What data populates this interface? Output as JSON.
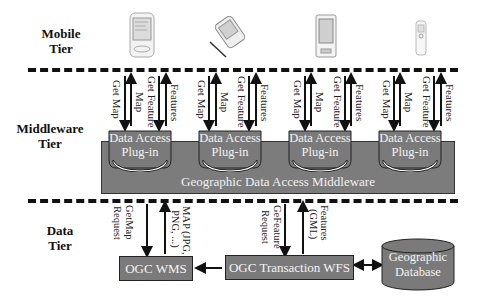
{
  "tiers": {
    "mobile": "Mobile Tier",
    "middleware": "Middleware Tier",
    "data": "Data Tier"
  },
  "tier_labels": {
    "mobile": [
      "Mobile",
      "Tier"
    ],
    "middleware": [
      "Middleware",
      "Tier"
    ],
    "data": [
      "Data",
      "Tier"
    ]
  },
  "devices": [
    {
      "name": "pocket-pc-device"
    },
    {
      "name": "pda-with-stylus-device"
    },
    {
      "name": "palm-device"
    },
    {
      "name": "mobile-phone-device"
    }
  ],
  "mobile_arrows": {
    "get_map": "Get Map",
    "map": "Map",
    "get_feature": "Get Feature",
    "features": "Features"
  },
  "plugins": [
    {
      "line1": "Data Access",
      "line2": "Plug-in"
    },
    {
      "line1": "Data Access",
      "line2": "Plug-in"
    },
    {
      "line1": "Data Access",
      "line2": "Plug-in"
    },
    {
      "line1": "Data Access",
      "line2": "Plug-in"
    }
  ],
  "middleware": {
    "label": "Geographic Data Access Middleware"
  },
  "data_arrows": {
    "getmap_request_1": "GetMap",
    "getmap_request_2": "Request",
    "map_response_1": "MAP (JPG,",
    "map_response_2": "PNG, ...)",
    "getfeature_request_1": "GeFeature",
    "getfeature_request_2": "Request",
    "features_gml_1": "Features",
    "features_gml_2": "(GML)"
  },
  "data_boxes": {
    "wms": "OGC WMS",
    "wfs": "OGC Transaction WFS",
    "database_line1": "Geographic",
    "database_line2": "Database"
  },
  "colors": {
    "box_fill": "#7a7a7a",
    "box_text": "#f4f4f4",
    "line": "#111111"
  }
}
